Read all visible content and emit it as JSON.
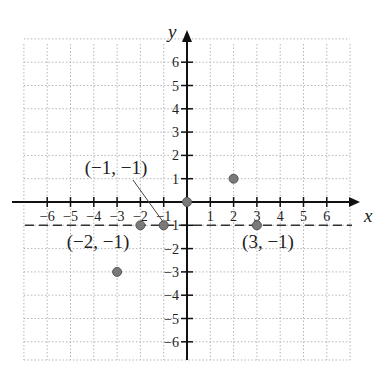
{
  "chart_data": {
    "type": "scatter",
    "title": "",
    "xlabel": "x",
    "ylabel": "y",
    "xlim": [
      -7,
      7
    ],
    "ylim": [
      -7,
      7
    ],
    "grid": true,
    "grid_style": "dotted",
    "x_ticks": [
      -6,
      -5,
      -4,
      -3,
      -2,
      -1,
      1,
      2,
      3,
      4,
      5,
      6
    ],
    "y_ticks": [
      -6,
      -5,
      -4,
      -3,
      -2,
      -1,
      1,
      2,
      3,
      4,
      5,
      6
    ],
    "x_tick_labels": [
      "−6",
      "−5",
      "−4",
      "−3",
      "−2",
      "−1",
      "1",
      "2",
      "3",
      "4",
      "5",
      "6"
    ],
    "y_tick_labels": [
      "−6",
      "−5",
      "−4",
      "−3",
      "−2",
      "−1",
      "1",
      "2",
      "3",
      "4",
      "5",
      "6"
    ],
    "points": [
      {
        "x": 0,
        "y": 0
      },
      {
        "x": 2,
        "y": 1
      },
      {
        "x": -1,
        "y": -1
      },
      {
        "x": -2,
        "y": -1
      },
      {
        "x": 3,
        "y": -1
      },
      {
        "x": -3,
        "y": -3
      }
    ],
    "reference_lines": [
      {
        "type": "horizontal",
        "y": -1,
        "style": "dashed"
      }
    ],
    "annotations": [
      {
        "text": "(−1, −1)",
        "point": {
          "x": -1,
          "y": -1
        },
        "leader_line": true
      },
      {
        "text": "(−2, −1)",
        "point": {
          "x": -2,
          "y": -1
        },
        "leader_line": false
      },
      {
        "text": "(3, −1)",
        "point": {
          "x": 3,
          "y": -1
        },
        "leader_line": false
      }
    ],
    "colors": {
      "axis": "#111111",
      "grid": "#b5b5b5",
      "point_fill": "#7a7a7a",
      "point_stroke": "#555555",
      "dashed_line": "#333333",
      "text": "#222222"
    }
  }
}
